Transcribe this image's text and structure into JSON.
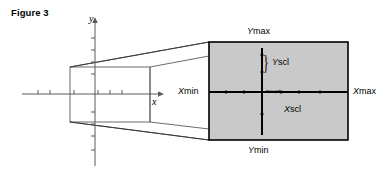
{
  "figure": {
    "title": "Figure 3",
    "axis_labels": {
      "y": "y",
      "x": "x"
    },
    "screen_labels": {
      "ymax": "Ymax",
      "ymin": "Ymin",
      "xmin": "Xmin",
      "xmax": "Xmax",
      "yscl": "Yscl",
      "xscl": "Xscl"
    },
    "colors": {
      "screen_fill": "#c9c9c9",
      "screen_border": "#000000",
      "line": "#4a4a4a",
      "axis_inner": "#000000",
      "background": "#ffffff"
    }
  }
}
